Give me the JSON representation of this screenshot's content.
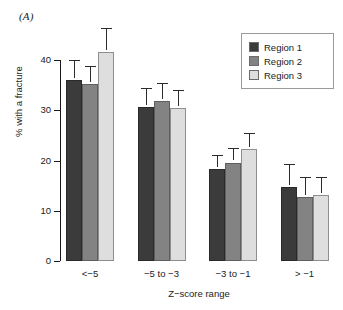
{
  "panel_label": "(A)",
  "chart_data": {
    "type": "bar",
    "title": "",
    "xlabel": "Z−score range",
    "ylabel": "% with a fracture",
    "ylim": [
      0,
      40
    ],
    "yticks": [
      0,
      10,
      20,
      30,
      40
    ],
    "ytick_labels": [
      "0",
      "10",
      "20",
      "30",
      "40"
    ],
    "grid": false,
    "legend_position": "top-right",
    "categories": [
      "<−5",
      "−5 to −3",
      "−3 to −1",
      "> −1"
    ],
    "series": [
      {
        "name": "Region 1",
        "color": "#3b3b3b",
        "values": [
          36.0,
          30.6,
          18.3,
          14.7
        ],
        "err_upper": [
          39.6,
          34.1,
          20.7,
          19.0
        ]
      },
      {
        "name": "Region 2",
        "color": "#838383",
        "values": [
          35.3,
          31.9,
          19.6,
          12.8
        ],
        "err_upper": [
          38.5,
          35.0,
          22.0,
          16.4
        ]
      },
      {
        "name": "Region 3",
        "color": "#dedede",
        "values": [
          41.5,
          30.5,
          22.2,
          13.1
        ],
        "err_upper": [
          46.0,
          33.7,
          25.1,
          16.3
        ]
      }
    ]
  },
  "legend": {
    "items": [
      {
        "label": "Region 1",
        "color": "#3b3b3b"
      },
      {
        "label": "Region 2",
        "color": "#838383"
      },
      {
        "label": "Region 3",
        "color": "#dedede"
      }
    ]
  }
}
